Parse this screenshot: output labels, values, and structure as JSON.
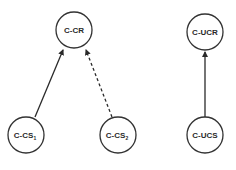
{
  "diagram": {
    "nodes": [
      {
        "id": "ccr",
        "label": "C-CR",
        "subscript": "",
        "cx": 74,
        "cy": 30,
        "r": 18
      },
      {
        "id": "ccs1",
        "label": "C-CS",
        "subscript": "1",
        "cx": 26,
        "cy": 135,
        "r": 18
      },
      {
        "id": "ccs2",
        "label": "C-CS",
        "subscript": "2",
        "cx": 118,
        "cy": 135,
        "r": 18
      },
      {
        "id": "cucr",
        "label": "C-UCR",
        "subscript": "",
        "cx": 205,
        "cy": 32,
        "r": 18
      },
      {
        "id": "cucs",
        "label": "C-UCS",
        "subscript": "",
        "cx": 205,
        "cy": 135,
        "r": 18
      }
    ],
    "edges": [
      {
        "from": "ccs1",
        "to": "ccr",
        "style": "solid"
      },
      {
        "from": "ccs2",
        "to": "ccr",
        "style": "dashed"
      },
      {
        "from": "cucs",
        "to": "cucr",
        "style": "solid"
      }
    ],
    "colors": {
      "stroke": "#333333",
      "text": "#2a2a2a",
      "background": "#ffffff"
    }
  }
}
